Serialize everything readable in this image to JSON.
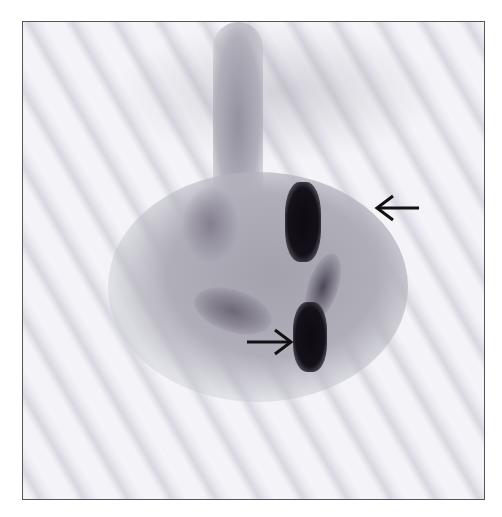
{
  "image": {
    "description": "Grayscale nuclear medicine scintigraphy (abdomen/pelvis) with focal intense tracer accumulation",
    "annotations": [
      {
        "type": "arrow",
        "direction": "left",
        "position": "upper right, pointing at upper intense uptake"
      },
      {
        "type": "arrow",
        "direction": "right",
        "position": "lower center, pointing at lower intense uptake"
      }
    ],
    "colors": {
      "background": "#ffffff",
      "frame_border": "#555555",
      "uptake": "#0d0a10",
      "soft_tissue": "#a9a8b2"
    }
  }
}
